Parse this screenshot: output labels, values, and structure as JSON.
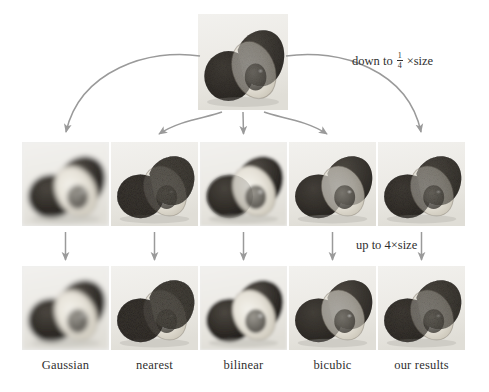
{
  "figure": {
    "source_image_label": "original high-resolution photo",
    "annotations": {
      "downscale": {
        "prefix": "down to",
        "fraction_numerator": "1",
        "fraction_denominator": "4",
        "suffix": "×size",
        "full_text": "down to 1/4 ×size"
      },
      "upscale": {
        "text": "up to 4×size"
      }
    },
    "columns": [
      {
        "id": "gaussian",
        "label": "Gaussian",
        "blur_px": 3.2,
        "grain": 0.0,
        "contrast": 0.86
      },
      {
        "id": "nearest",
        "label": "nearest",
        "blur_px": 0.0,
        "grain": 0.85,
        "contrast": 1.12
      },
      {
        "id": "bilinear",
        "label": "bilinear",
        "blur_px": 1.5,
        "grain": 0.1,
        "contrast": 0.95
      },
      {
        "id": "bicubic",
        "label": "bicubic",
        "blur_px": 1.0,
        "grain": 0.28,
        "contrast": 1.0
      },
      {
        "id": "our-results",
        "label": "our results",
        "blur_px": 0.35,
        "grain": 0.55,
        "contrast": 1.05
      }
    ],
    "rows": [
      {
        "id": "downsampled",
        "caption_visible": false
      },
      {
        "id": "upsampled",
        "caption_visible": true
      }
    ],
    "arrow_color": "#9a9a9a",
    "text_color": "#2f2f2f",
    "background_color": "#ffffff"
  }
}
